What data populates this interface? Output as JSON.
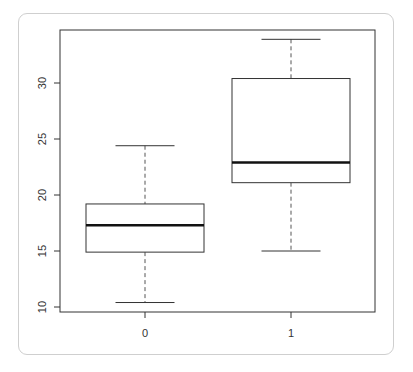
{
  "chart_data": {
    "type": "boxplot",
    "title": "",
    "xlabel": "",
    "ylabel": "",
    "categories": [
      "0",
      "1"
    ],
    "ylim": [
      9.5,
      35.5
    ],
    "yticks": [
      "10",
      "15",
      "20",
      "25",
      "30"
    ],
    "grid": false,
    "legend": null,
    "boxes": [
      {
        "category": "0",
        "whisker_low": 10.4,
        "q1": 14.9,
        "median": 17.3,
        "q3": 19.2,
        "whisker_high": 24.4
      },
      {
        "category": "1",
        "whisker_low": 15.0,
        "q1": 21.1,
        "median": 22.9,
        "q3": 30.4,
        "whisker_high": 33.9
      }
    ]
  },
  "axes": {
    "x_labels": [
      "0",
      "1"
    ],
    "y_labels": [
      "10",
      "15",
      "20",
      "25",
      "30"
    ]
  }
}
